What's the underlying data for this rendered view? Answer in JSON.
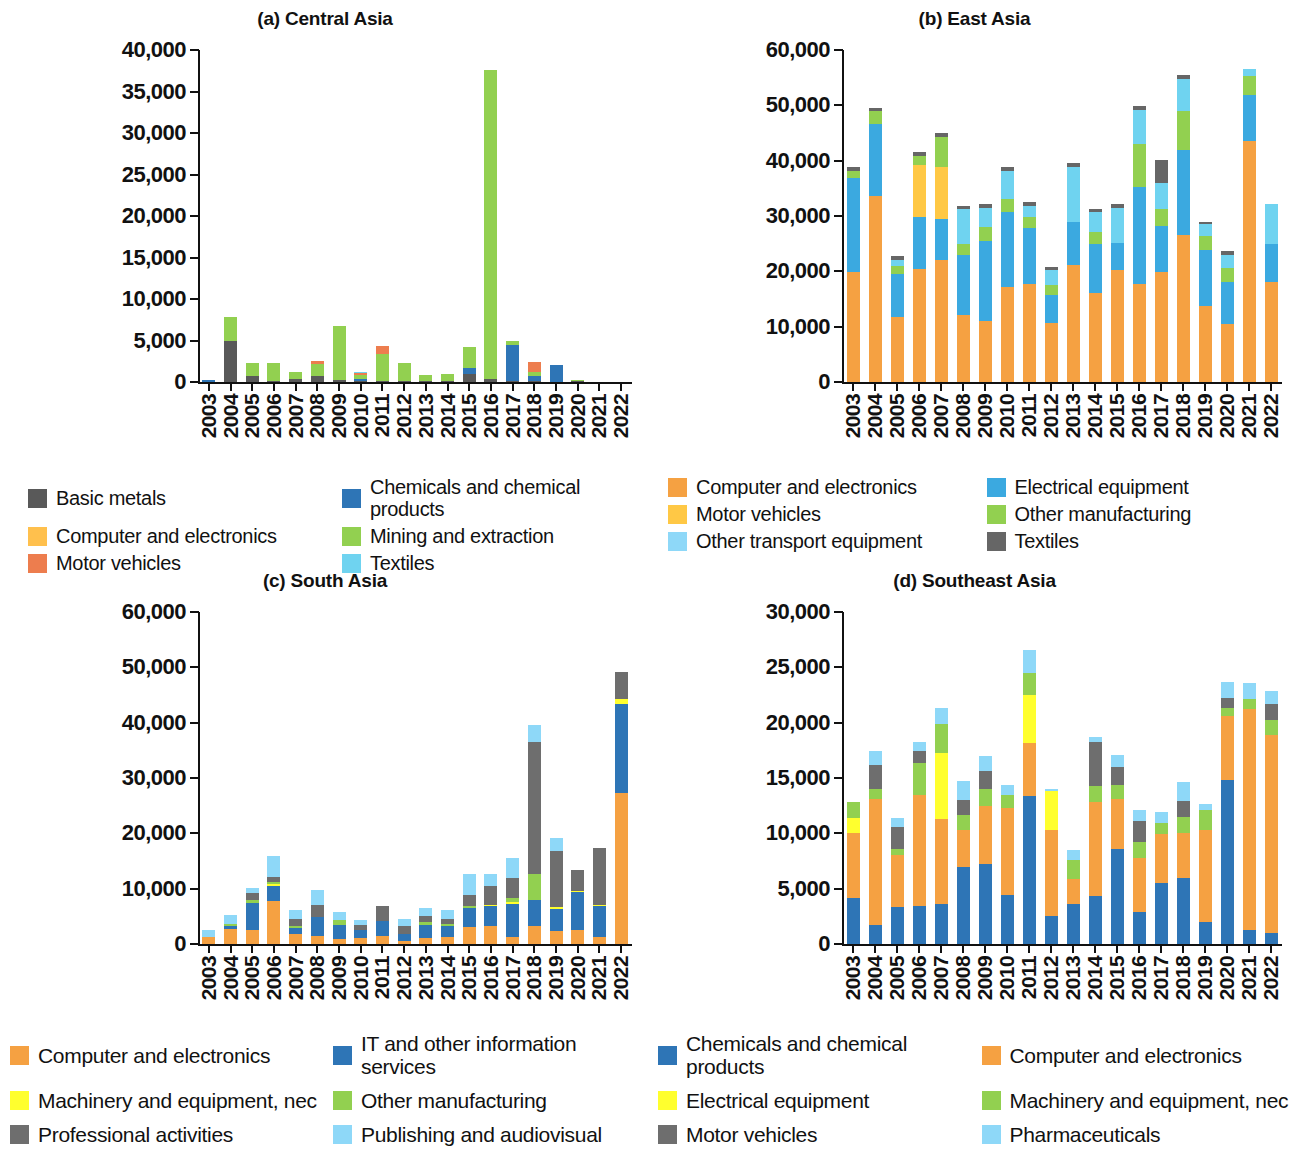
{
  "figure": {
    "panels": [
      "Central Asia",
      "East Asia",
      "South Asia",
      "Southeast Asia"
    ]
  },
  "chart_data": [
    {
      "type": "bar",
      "stacked": true,
      "title": "(a) Central Asia",
      "panel_id": "a",
      "xlabel": "",
      "ylabel": "",
      "ylim": [
        0,
        40000
      ],
      "yticks": [
        0,
        5000,
        10000,
        15000,
        20000,
        25000,
        30000,
        35000,
        40000
      ],
      "ytick_labels": [
        "0",
        "5,000",
        "10,000",
        "15,000",
        "20,000",
        "25,000",
        "30,000",
        "35,000",
        "40,000"
      ],
      "grid": false,
      "legend_position": "below",
      "categories": [
        "2003",
        "2004",
        "2005",
        "2006",
        "2007",
        "2008",
        "2009",
        "2010",
        "2011",
        "2012",
        "2013",
        "2014",
        "2015",
        "2016",
        "2017",
        "2018",
        "2019",
        "2020",
        "2021",
        "2022"
      ],
      "series": [
        {
          "name": "Basic metals",
          "color": "#595959",
          "values": [
            0,
            4900,
            700,
            60,
            400,
            700,
            300,
            120,
            100,
            50,
            100,
            160,
            1000,
            350,
            60,
            80,
            0,
            30,
            0,
            0
          ]
        },
        {
          "name": "Chemicals and chemical products",
          "color": "#2E75B6",
          "values": [
            230,
            0,
            0,
            0,
            0,
            0,
            0,
            250,
            0,
            0,
            0,
            0,
            700,
            0,
            4300,
            550,
            2050,
            0,
            0,
            0
          ]
        },
        {
          "name": "Computer and electronics",
          "color": "#FFC04D",
          "values": [
            0,
            0,
            0,
            0,
            0,
            0,
            0,
            0,
            0,
            0,
            0,
            0,
            0,
            0,
            0,
            0,
            0,
            0,
            0,
            0
          ]
        },
        {
          "name": "Mining and extraction",
          "color": "#92D050",
          "values": [
            0,
            2900,
            1650,
            2200,
            800,
            1500,
            6400,
            420,
            3200,
            2200,
            750,
            750,
            2500,
            37200,
            550,
            500,
            0,
            60,
            0,
            0
          ]
        },
        {
          "name": "Motor vehicles",
          "color": "#ED7D4E",
          "values": [
            0,
            0,
            0,
            0,
            0,
            350,
            0,
            300,
            1000,
            0,
            0,
            0,
            0,
            0,
            0,
            1250,
            0,
            0,
            0,
            0
          ]
        },
        {
          "name": "Textiles",
          "color": "#6FD3F0",
          "values": [
            0,
            0,
            0,
            0,
            0,
            0,
            0,
            150,
            0,
            0,
            0,
            0,
            0,
            0,
            0,
            0,
            0,
            0,
            0,
            0
          ]
        }
      ]
    },
    {
      "type": "bar",
      "stacked": true,
      "title": "(b) East Asia",
      "panel_id": "b",
      "xlabel": "",
      "ylabel": "",
      "ylim": [
        0,
        60000
      ],
      "yticks": [
        0,
        10000,
        20000,
        30000,
        40000,
        50000,
        60000
      ],
      "ytick_labels": [
        "0",
        "10,000",
        "20,000",
        "30,000",
        "40,000",
        "50,000",
        "60,000"
      ],
      "grid": false,
      "legend_position": "below",
      "categories": [
        "2003",
        "2004",
        "2005",
        "2006",
        "2007",
        "2008",
        "2009",
        "2010",
        "2011",
        "2012",
        "2013",
        "2014",
        "2015",
        "2016",
        "2017",
        "2018",
        "2019",
        "2020",
        "2021",
        "2022"
      ],
      "series": [
        {
          "name": "Computer and electronics",
          "color": "#F5A142",
          "values": [
            19900,
            33600,
            11800,
            20500,
            22000,
            12200,
            11100,
            17200,
            17800,
            10700,
            21200,
            16000,
            20200,
            17800,
            19900,
            26500,
            13800,
            10400,
            43500,
            18000
          ]
        },
        {
          "name": "Electrical equipment",
          "color": "#3BA9E0",
          "values": [
            17000,
            13100,
            7800,
            9400,
            7400,
            10700,
            14400,
            13600,
            10000,
            5000,
            7800,
            9000,
            4900,
            17500,
            8300,
            15500,
            10000,
            7700,
            8300,
            6900
          ]
        },
        {
          "name": "Motor vehicles",
          "color": "#FFC845",
          "values": [
            0,
            0,
            0,
            9400,
            9500,
            0,
            0,
            0,
            0,
            0,
            0,
            0,
            0,
            0,
            0,
            0,
            0,
            0,
            0,
            0
          ]
        },
        {
          "name": "Other manufacturing",
          "color": "#92D050",
          "values": [
            1200,
            2200,
            1300,
            1600,
            5400,
            2000,
            2500,
            2300,
            2100,
            1800,
            0,
            2200,
            0,
            7800,
            3000,
            7000,
            2600,
            2600,
            3500,
            0
          ]
        },
        {
          "name": "Other transport equipment",
          "color": "#6FD3F0",
          "values": [
            0,
            0,
            1100,
            0,
            0,
            6300,
            3400,
            5000,
            2000,
            2800,
            9900,
            3600,
            6400,
            6100,
            4700,
            5800,
            2200,
            2300,
            1200,
            7200
          ]
        },
        {
          "name": "Textiles",
          "color": "#666666",
          "values": [
            700,
            650,
            700,
            700,
            700,
            700,
            700,
            700,
            700,
            500,
            700,
            500,
            700,
            700,
            4300,
            700,
            350,
            700,
            0,
            0
          ]
        }
      ]
    },
    {
      "type": "bar",
      "stacked": true,
      "title": "(c) South Asia",
      "panel_id": "c",
      "xlabel": "",
      "ylabel": "",
      "ylim": [
        0,
        60000
      ],
      "yticks": [
        0,
        10000,
        20000,
        30000,
        40000,
        50000,
        60000
      ],
      "ytick_labels": [
        "0",
        "10,000",
        "20,000",
        "30,000",
        "40,000",
        "50,000",
        "60,000"
      ],
      "grid": false,
      "legend_position": "below",
      "categories": [
        "2003",
        "2004",
        "2005",
        "2006",
        "2007",
        "2008",
        "2009",
        "2010",
        "2011",
        "2012",
        "2013",
        "2014",
        "2015",
        "2016",
        "2017",
        "2018",
        "2019",
        "2020",
        "2021",
        "2022"
      ],
      "series": [
        {
          "name": "Computer and electronics",
          "color": "#F5A142",
          "values": [
            1200,
            2700,
            2600,
            7700,
            1800,
            1400,
            900,
            1100,
            1500,
            600,
            1100,
            1300,
            3000,
            3300,
            1200,
            3300,
            2400,
            2500,
            1200,
            27300
          ]
        },
        {
          "name": "IT and other information services",
          "color": "#2E75B6",
          "values": [
            0,
            600,
            4800,
            2700,
            1100,
            3400,
            2600,
            1500,
            2600,
            1300,
            2300,
            1900,
            3500,
            3500,
            6100,
            4700,
            4000,
            6900,
            5600,
            16100
          ]
        },
        {
          "name": "Machinery and equipment, nec",
          "color": "#FFFF2E",
          "values": [
            0,
            0,
            0,
            400,
            0,
            0,
            0,
            0,
            0,
            0,
            0,
            0,
            0,
            300,
            300,
            0,
            300,
            200,
            300,
            900
          ]
        },
        {
          "name": "Other manufacturing",
          "color": "#92D050",
          "values": [
            0,
            400,
            600,
            400,
            300,
            0,
            900,
            0,
            0,
            0,
            600,
            400,
            400,
            0,
            800,
            4700,
            0,
            0,
            0,
            0
          ]
        },
        {
          "name": "Professional activities",
          "color": "#6E6E6E",
          "values": [
            0,
            0,
            1300,
            900,
            1300,
            2300,
            0,
            800,
            2700,
            1400,
            1100,
            900,
            1900,
            3300,
            3500,
            23800,
            10100,
            3800,
            10200,
            4900
          ]
        },
        {
          "name": "Publishing and audiovisual",
          "color": "#8ED8F8",
          "values": [
            1300,
            1600,
            800,
            3800,
            1700,
            2700,
            1400,
            900,
            0,
            1200,
            1400,
            1600,
            3900,
            2300,
            3700,
            3100,
            2400,
            0,
            0,
            0
          ]
        }
      ]
    },
    {
      "type": "bar",
      "stacked": true,
      "title": "(d) Southeast Asia",
      "panel_id": "d",
      "xlabel": "",
      "ylabel": "",
      "ylim": [
        0,
        30000
      ],
      "yticks": [
        0,
        5000,
        10000,
        15000,
        20000,
        25000,
        30000
      ],
      "ytick_labels": [
        "0",
        "5,000",
        "10,000",
        "15,000",
        "20,000",
        "25,000",
        "30,000"
      ],
      "grid": false,
      "legend_position": "below",
      "categories": [
        "2003",
        "2004",
        "2005",
        "2006",
        "2007",
        "2008",
        "2009",
        "2010",
        "2011",
        "2012",
        "2013",
        "2014",
        "2015",
        "2016",
        "2017",
        "2018",
        "2019",
        "2020",
        "2021",
        "2022"
      ],
      "series": [
        {
          "name": "Chemicals and chemical products",
          "color": "#2E75B6",
          "values": [
            4200,
            1700,
            3300,
            3400,
            3600,
            7000,
            7200,
            4400,
            13400,
            2500,
            3600,
            4300,
            8600,
            2900,
            5500,
            6000,
            2000,
            14800,
            1300,
            1000
          ]
        },
        {
          "name": "Computer and electronics",
          "color": "#F5A142",
          "values": [
            5800,
            11400,
            4700,
            10100,
            7700,
            3300,
            5300,
            7900,
            4800,
            7800,
            2300,
            8500,
            4500,
            4900,
            4400,
            4000,
            8300,
            5800,
            19900,
            17900
          ]
        },
        {
          "name": "Electrical equipment",
          "color": "#FFFF2E",
          "values": [
            1400,
            0,
            0,
            0,
            6000,
            0,
            0,
            0,
            4300,
            3500,
            0,
            0,
            0,
            0,
            0,
            0,
            0,
            0,
            0,
            0
          ]
        },
        {
          "name": "Machinery and equipment, nec",
          "color": "#92D050",
          "values": [
            1400,
            900,
            600,
            2900,
            2600,
            1400,
            1500,
            1200,
            2000,
            0,
            1700,
            1500,
            1300,
            1400,
            1000,
            1500,
            1800,
            700,
            900,
            1300
          ]
        },
        {
          "name": "Motor vehicles",
          "color": "#6E6E6E",
          "values": [
            0,
            2200,
            2000,
            1000,
            0,
            1300,
            1600,
            0,
            0,
            0,
            0,
            4000,
            1600,
            1900,
            0,
            1400,
            0,
            900,
            0,
            1500
          ]
        },
        {
          "name": "Pharmaceuticals",
          "color": "#8ED8F8",
          "values": [
            0,
            1200,
            800,
            900,
            1400,
            1700,
            1400,
            900,
            2100,
            200,
            900,
            400,
            1100,
            1000,
            1000,
            1700,
            600,
            1500,
            1500,
            1200
          ]
        }
      ]
    }
  ],
  "legends": {
    "top_left": [
      {
        "label": "Basic metals",
        "color": "#595959"
      },
      {
        "label": "Chemicals and chemical products",
        "color": "#2E75B6"
      },
      {
        "label": "Computer and electronics",
        "color": "#FFC04D"
      },
      {
        "label": "Mining and extraction",
        "color": "#92D050"
      },
      {
        "label": "Motor vehicles",
        "color": "#ED7D4E"
      },
      {
        "label": "Textiles",
        "color": "#6FD3F0"
      }
    ],
    "top_right": [
      {
        "label": "Computer and electronics",
        "color": "#F5A142"
      },
      {
        "label": "Electrical equipment",
        "color": "#3BA9E0"
      },
      {
        "label": "Motor vehicles",
        "color": "#FFC845"
      },
      {
        "label": "Other manufacturing",
        "color": "#92D050"
      },
      {
        "label": "Other transport equipment",
        "color": "#8ED8F8"
      },
      {
        "label": "Textiles",
        "color": "#666666"
      }
    ],
    "bottom_left": [
      {
        "label": "Computer and electronics",
        "color": "#F5A142"
      },
      {
        "label": "IT and other information services",
        "color": "#2E75B6"
      },
      {
        "label": "Machinery and equipment, nec",
        "color": "#FFFF2E"
      },
      {
        "label": "Other manufacturing",
        "color": "#92D050"
      },
      {
        "label": "Professional activities",
        "color": "#6E6E6E"
      },
      {
        "label": "Publishing and audiovisual",
        "color": "#8ED8F8"
      }
    ],
    "bottom_right": [
      {
        "label": "Chemicals and chemical products",
        "color": "#2E75B6"
      },
      {
        "label": "Computer and electronics",
        "color": "#F5A142"
      },
      {
        "label": "Electrical equipment",
        "color": "#FFFF2E"
      },
      {
        "label": "Machinery and equipment, nec",
        "color": "#92D050"
      },
      {
        "label": "Motor vehicles",
        "color": "#6E6E6E"
      },
      {
        "label": "Pharmaceuticals",
        "color": "#8ED8F8"
      }
    ]
  }
}
